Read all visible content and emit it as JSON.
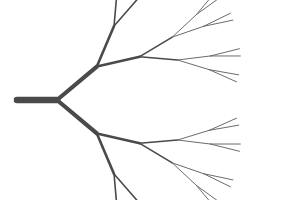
{
  "image": {
    "title": "Binary Branching Tree",
    "subject": "fractal-dendrite",
    "width": 295,
    "height": 200,
    "background_color": "#ffffff"
  },
  "style": {
    "stroke_color": "#4a4a4a",
    "stroke_color_light": "#6b6b6b",
    "trunk_width": 6.5,
    "linecap": "round"
  },
  "tree": {
    "description": "Symmetric recursive binary tree branching left-to-right",
    "levels": 5,
    "tip_count": 32,
    "root": {
      "x": 17,
      "y": 100
    },
    "trunk_end": {
      "x": 57,
      "y": 100
    },
    "trunk_angle_deg": 0,
    "branch_angles_deg": [
      40,
      27,
      18,
      12,
      7
    ],
    "branch_lengths": [
      52,
      44,
      38,
      33,
      30
    ],
    "branch_widths": [
      6.5,
      4.2,
      2.6,
      1.6,
      1.0
    ],
    "tip_x_extent": 283,
    "tip_y_min": 10,
    "tip_y_max": 190,
    "symmetry": "vertical-mirror"
  },
  "chart_data": {
    "type": "line",
    "xlabel": "",
    "ylabel": "",
    "xlim": [
      0,
      295
    ],
    "ylim": [
      0,
      200
    ],
    "grid": false,
    "legend": "none",
    "series": [
      {
        "name": "trunk",
        "depth": 0,
        "stroke_width": 6.5,
        "x": [
          17,
          57
        ],
        "y": [
          100,
          100
        ]
      },
      {
        "name": "level-1-upper",
        "depth": 1,
        "stroke_width": 4.2,
        "x": [
          57,
          92
        ],
        "y": [
          100,
          67
        ]
      },
      {
        "name": "level-1-lower",
        "depth": 1,
        "stroke_width": 4.2,
        "x": [
          57,
          92
        ],
        "y": [
          100,
          133
        ]
      }
    ],
    "node_levels": [
      {
        "depth": 0,
        "x": 57,
        "y": 100,
        "count": 1
      },
      {
        "depth": 1,
        "x": 92,
        "y": 67,
        "count": 2
      },
      {
        "depth": 2,
        "x": 128,
        "y": 42,
        "count": 4
      },
      {
        "depth": 3,
        "x": 168,
        "y": 26,
        "count": 8
      },
      {
        "depth": 4,
        "x": 215,
        "y": 17,
        "count": 16
      },
      {
        "depth": 5,
        "x": 283,
        "y": 10,
        "count": 32
      }
    ]
  }
}
